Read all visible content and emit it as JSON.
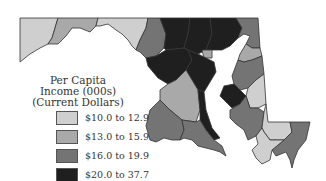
{
  "map": {
    "title_lines": [
      "Per Capita",
      "Income (000s)",
      "(Current Dollars)"
    ],
    "legend": [
      {
        "label": "$10.0 to 12.9",
        "color": "#cfcfcf"
      },
      {
        "label": "$13.0 to 15.9",
        "color": "#a9a9a9"
      },
      {
        "label": "$16.0 to 19.9",
        "color": "#747474"
      },
      {
        "label": "$20.0 to 37.7",
        "color": "#1f1f1f"
      }
    ]
  }
}
